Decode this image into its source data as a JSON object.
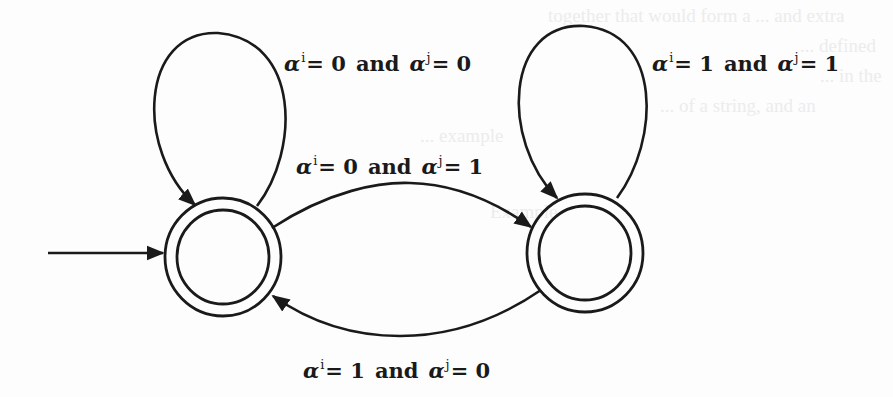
{
  "diagram": {
    "type": "finite-state-automaton",
    "stroke_color": "#1a1a1a",
    "background_color": "#fdfdfd",
    "states": [
      {
        "id": "s0",
        "position": "left",
        "accepting": true,
        "initial": true
      },
      {
        "id": "s1",
        "position": "right",
        "accepting": true,
        "initial": false
      }
    ],
    "transitions": [
      {
        "id": "loop-s0",
        "from": "s0",
        "to": "s0",
        "label": {
          "sym1": "α",
          "sup1": "i",
          "rel1": "= 0",
          "conj": "and",
          "sym2": "α",
          "sup2": "j",
          "rel2": "= 0"
        }
      },
      {
        "id": "loop-s1",
        "from": "s1",
        "to": "s1",
        "label": {
          "sym1": "α",
          "sup1": "i",
          "rel1": "= 1",
          "conj": "and",
          "sym2": "α",
          "sup2": "j",
          "rel2": "= 1"
        }
      },
      {
        "id": "s0-to-s1",
        "from": "s0",
        "to": "s1",
        "label": {
          "sym1": "α",
          "sup1": "i",
          "rel1": "= 0",
          "conj": "and",
          "sym2": "α",
          "sup2": "j",
          "rel2": "= 1"
        }
      },
      {
        "id": "s1-to-s0",
        "from": "s1",
        "to": "s0",
        "label": {
          "sym1": "α",
          "sup1": "i",
          "rel1": "= 1",
          "conj": "and",
          "sym2": "α",
          "sup2": "j",
          "rel2": "= 0"
        }
      }
    ]
  },
  "bleed_through_text": [
    "together that would form a ... and extra",
    "... defined",
    "... in the",
    "... of a string, and an",
    "... example",
    "Example"
  ]
}
